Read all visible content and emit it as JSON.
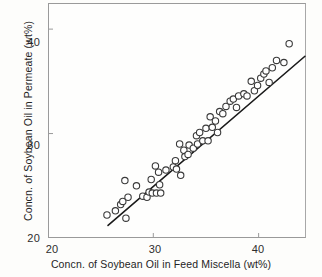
{
  "chart_data": {
    "type": "scatter",
    "title": "",
    "xlabel": "Concn. of Soybean Oil in Feed Miscella (wt%)",
    "ylabel": "Concn. of Soybean Oil in Permeate (wt%)",
    "xlim": [
      20,
      44.5
    ],
    "ylim": [
      20,
      42.5
    ],
    "xticks": [
      20,
      30,
      40
    ],
    "yticks": [
      20,
      30,
      40
    ],
    "xticklabels": [
      "20",
      "30",
      "40"
    ],
    "yticklabels": [
      "20",
      "30",
      "40"
    ],
    "grid": false,
    "legend": null,
    "marker": "open-circle",
    "marker_color": "#ffffff",
    "marker_edge_color": "#3a3a3a",
    "line_color": "#1a1a1a",
    "frame_color": "#9a9a9a",
    "background_color": "#fefefd",
    "fit_line": {
      "label": "linear fit",
      "x": [
        25.7,
        44.4
      ],
      "y": [
        21.2,
        37.4
      ]
    },
    "points": [
      {
        "x": 25.6,
        "y": 22.2
      },
      {
        "x": 26.4,
        "y": 22.6
      },
      {
        "x": 26.9,
        "y": 23.2
      },
      {
        "x": 27.1,
        "y": 23.5
      },
      {
        "x": 27.3,
        "y": 25.5
      },
      {
        "x": 27.4,
        "y": 21.9
      },
      {
        "x": 27.6,
        "y": 23.9
      },
      {
        "x": 28.4,
        "y": 25.0
      },
      {
        "x": 29.0,
        "y": 24.0
      },
      {
        "x": 29.4,
        "y": 23.9
      },
      {
        "x": 29.6,
        "y": 24.4
      },
      {
        "x": 29.8,
        "y": 25.6
      },
      {
        "x": 29.9,
        "y": 24.3
      },
      {
        "x": 30.2,
        "y": 26.9
      },
      {
        "x": 30.3,
        "y": 24.3
      },
      {
        "x": 30.5,
        "y": 26.3
      },
      {
        "x": 30.6,
        "y": 25.1
      },
      {
        "x": 30.7,
        "y": 24.3
      },
      {
        "x": 31.2,
        "y": 26.5
      },
      {
        "x": 31.9,
        "y": 26.8
      },
      {
        "x": 32.1,
        "y": 27.4
      },
      {
        "x": 32.2,
        "y": 26.6
      },
      {
        "x": 32.5,
        "y": 29.0
      },
      {
        "x": 32.6,
        "y": 26.0
      },
      {
        "x": 32.9,
        "y": 28.4
      },
      {
        "x": 33.0,
        "y": 27.8
      },
      {
        "x": 33.3,
        "y": 28.0
      },
      {
        "x": 33.4,
        "y": 28.9
      },
      {
        "x": 33.8,
        "y": 28.6
      },
      {
        "x": 34.1,
        "y": 29.8
      },
      {
        "x": 34.2,
        "y": 29.0
      },
      {
        "x": 34.4,
        "y": 30.1
      },
      {
        "x": 34.7,
        "y": 29.3
      },
      {
        "x": 35.0,
        "y": 30.5
      },
      {
        "x": 35.2,
        "y": 29.3
      },
      {
        "x": 35.4,
        "y": 31.6
      },
      {
        "x": 35.6,
        "y": 30.6
      },
      {
        "x": 35.9,
        "y": 31.2
      },
      {
        "x": 36.1,
        "y": 30.1
      },
      {
        "x": 36.3,
        "y": 32.1
      },
      {
        "x": 36.6,
        "y": 31.9
      },
      {
        "x": 36.9,
        "y": 32.6
      },
      {
        "x": 37.3,
        "y": 33.1
      },
      {
        "x": 37.6,
        "y": 33.3
      },
      {
        "x": 37.9,
        "y": 32.5
      },
      {
        "x": 38.1,
        "y": 33.6
      },
      {
        "x": 38.6,
        "y": 33.8
      },
      {
        "x": 38.9,
        "y": 33.6
      },
      {
        "x": 39.3,
        "y": 35.0
      },
      {
        "x": 39.6,
        "y": 34.1
      },
      {
        "x": 39.9,
        "y": 34.6
      },
      {
        "x": 40.2,
        "y": 35.3
      },
      {
        "x": 40.5,
        "y": 35.7
      },
      {
        "x": 40.7,
        "y": 36.0
      },
      {
        "x": 41.0,
        "y": 34.9
      },
      {
        "x": 41.3,
        "y": 36.3
      },
      {
        "x": 41.7,
        "y": 37.0
      },
      {
        "x": 42.4,
        "y": 36.8
      },
      {
        "x": 42.9,
        "y": 38.6
      }
    ]
  },
  "axes": {
    "y_tick_labels": [
      "40",
      "30",
      "20"
    ],
    "x_tick_labels": [
      "20",
      "30",
      "40"
    ]
  }
}
